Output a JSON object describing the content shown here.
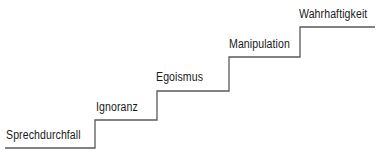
{
  "diagram": {
    "type": "staircase",
    "line_color": "#555555",
    "steps": [
      {
        "label": "Sprechdurchfall"
      },
      {
        "label": "Ignoranz"
      },
      {
        "label": "Egoismus"
      },
      {
        "label": "Manipulation"
      },
      {
        "label": "Wahrhaftigkeit"
      }
    ]
  }
}
